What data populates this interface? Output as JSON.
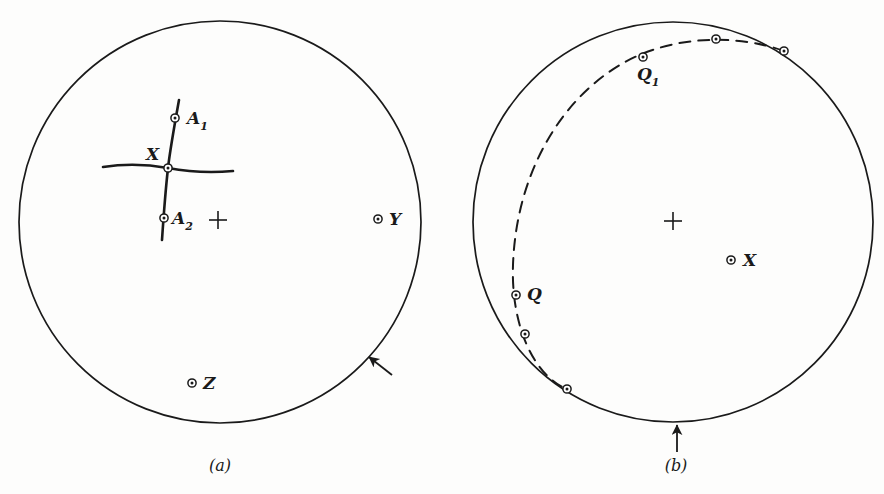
{
  "figure": {
    "caption_a": "(a)",
    "caption_b": "(b)",
    "background_color": "#fdfdfc",
    "ink_color": "#1a1a1a"
  },
  "chart_data": {
    "type": "scatter",
    "title": "",
    "subtitle": "",
    "xlabel": "",
    "ylabel": "",
    "grid": false,
    "legend": "none",
    "panels": [
      {
        "id": "a",
        "caption": "(a)",
        "caption_x": 220,
        "caption_y": 465,
        "primitive_circle": {
          "cx": 220,
          "cy": 222,
          "r": 201
        },
        "center_cross": {
          "x": 218,
          "y": 220,
          "size": 9
        },
        "points": [
          {
            "label": "A1",
            "label_text": "A",
            "label_sub": "1",
            "x": 175,
            "y": 118,
            "label_dx": 12,
            "label_dy": 2,
            "marker": "circle-dot"
          },
          {
            "label": "X",
            "label_text": "X",
            "label_sub": "",
            "x": 168,
            "y": 168,
            "label_dx": -22,
            "label_dy": -14,
            "marker": "circle-dot"
          },
          {
            "label": "A2",
            "label_text": "A",
            "label_sub": "2",
            "x": 164,
            "y": 218,
            "label_dx": 8,
            "label_dy": 2,
            "marker": "circle-dot"
          },
          {
            "label": "Y",
            "label_text": "Y",
            "label_sub": "",
            "x": 378,
            "y": 219,
            "label_dx": 11,
            "label_dy": 0,
            "marker": "circle-dot"
          },
          {
            "label": "Z",
            "label_text": "Z",
            "label_sub": "",
            "x": 192,
            "y": 383,
            "label_dx": 11,
            "label_dy": 0,
            "marker": "circle-dot"
          }
        ],
        "traces": [
          {
            "name": "vertical-great-circle-trace",
            "d": "M 179 100 Q 170 150 168 168 Q 165 195 162 240"
          },
          {
            "name": "horizontal-great-circle-trace",
            "d": "M 103 167 Q 135 162 168 168 Q 200 174 233 171"
          }
        ],
        "edge_arrow": {
          "name": "edge-arrow-a",
          "x1": 392,
          "y1": 375,
          "x2": 369,
          "y2": 357
        }
      },
      {
        "id": "b",
        "caption": "(b)",
        "caption_x": 676,
        "caption_y": 465,
        "primitive_circle": {
          "cx": 673,
          "cy": 222,
          "r": 200
        },
        "center_cross": {
          "x": 673,
          "y": 221,
          "size": 9
        },
        "points": [
          {
            "label": "",
            "label_text": "",
            "label_sub": "",
            "x": 784,
            "y": 51,
            "label_dx": 0,
            "label_dy": 0,
            "marker": "circle-dot"
          },
          {
            "label": "",
            "label_text": "",
            "label_sub": "",
            "x": 716,
            "y": 39,
            "label_dx": 0,
            "label_dy": 0,
            "marker": "circle-dot"
          },
          {
            "label": "Q1",
            "label_text": "Q",
            "label_sub": "1",
            "x": 643,
            "y": 57,
            "label_dx": -6,
            "label_dy": 19,
            "marker": "circle-dot"
          },
          {
            "label": "Q",
            "label_text": "Q",
            "label_sub": "",
            "x": 516,
            "y": 295,
            "label_dx": 11,
            "label_dy": -1,
            "marker": "circle-dot"
          },
          {
            "label": "",
            "label_text": "",
            "label_sub": "",
            "x": 525,
            "y": 334,
            "label_dx": 0,
            "label_dy": 0,
            "marker": "circle-dot"
          },
          {
            "label": "",
            "label_text": "",
            "label_sub": "",
            "x": 567,
            "y": 389,
            "label_dx": 0,
            "label_dy": 0,
            "marker": "circle-dot"
          },
          {
            "label": "X",
            "label_text": "X",
            "label_sub": "",
            "x": 731,
            "y": 260,
            "label_dx": 12,
            "label_dy": 0,
            "marker": "circle-dot"
          }
        ],
        "traces": [
          {
            "name": "dashed-great-circle-trace",
            "d": "M 784 51 C 740 35 676 34 625 62 C 560 98 516 175 513 265 C 511 320 530 372 566 389",
            "dashed": true
          }
        ],
        "edge_arrow": {
          "name": "edge-arrow-b",
          "x1": 677,
          "y1": 452,
          "x2": 677,
          "y2": 425
        }
      }
    ]
  }
}
